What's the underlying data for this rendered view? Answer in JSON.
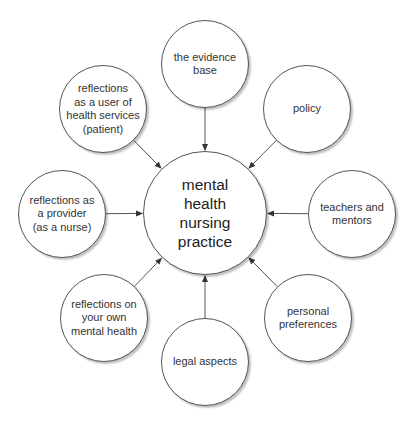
{
  "diagram": {
    "center": {
      "label": "mental\nhealth\nnursing\npractice",
      "x": 205,
      "y": 213,
      "r": 62
    },
    "nodes": [
      {
        "id": "evidence-base",
        "label": "the evidence\nbase",
        "x": 205,
        "y": 64,
        "r": 44
      },
      {
        "id": "policy",
        "label": "policy",
        "x": 307,
        "y": 109,
        "r": 44
      },
      {
        "id": "teachers-mentors",
        "label": "teachers and\nmentors",
        "x": 352,
        "y": 214,
        "r": 44
      },
      {
        "id": "personal-preferences",
        "label": "personal\npreferences",
        "x": 308,
        "y": 318,
        "r": 44
      },
      {
        "id": "legal-aspects",
        "label": "legal aspects",
        "x": 205,
        "y": 362,
        "r": 44
      },
      {
        "id": "reflections-own-mental-health",
        "label": "reflections on\nyour own\nmental health",
        "x": 104,
        "y": 318,
        "r": 44
      },
      {
        "id": "reflections-provider",
        "label": "reflections as\na provider\n(as a nurse)",
        "x": 62,
        "y": 214,
        "r": 44
      },
      {
        "id": "reflections-user",
        "label": "reflections\nas a user of\nhealth services\n(patient)",
        "x": 103,
        "y": 109,
        "r": 44
      }
    ],
    "edge_direction": "outer-to-center",
    "colors": {
      "stroke": "#555555",
      "text": "#333333",
      "background": "#ffffff"
    }
  }
}
